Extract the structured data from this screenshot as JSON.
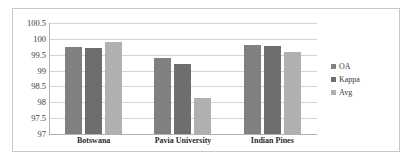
{
  "chart_data": {
    "type": "bar",
    "title": "",
    "xlabel": "",
    "ylabel": "",
    "ylim": [
      97,
      100.5
    ],
    "yticks": [
      "100.5",
      "100",
      "99.5",
      "99",
      "98.5",
      "98",
      "97.5",
      "97"
    ],
    "ytick_values": [
      100.5,
      100,
      99.5,
      99,
      98.5,
      98,
      97.5,
      97
    ],
    "grid": true,
    "legend_position": "right",
    "categories": [
      "Botswana",
      "Pavia University",
      "Indian Pines"
    ],
    "series": [
      {
        "name": "OA",
        "color": "#808080",
        "values": [
          99.75,
          99.4,
          99.8
        ]
      },
      {
        "name": "Kappa",
        "color": "#6e6e6e",
        "values": [
          99.7,
          99.2,
          99.78
        ]
      },
      {
        "name": "Avg",
        "color": "#b0b0b0",
        "values": [
          99.9,
          98.15,
          99.6
        ]
      }
    ]
  },
  "legend": {
    "items": [
      {
        "label": "OA"
      },
      {
        "label": "Kappa"
      },
      {
        "label": "Avg"
      }
    ]
  }
}
